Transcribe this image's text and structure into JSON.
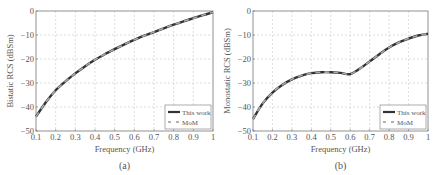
{
  "chart_data": [
    {
      "type": "line",
      "panel_label": "(a)",
      "title": "",
      "xlabel": "Frequency (GHz)",
      "ylabel": "Bistatic RCS (dBSm)",
      "xlim": [
        0.1,
        1
      ],
      "ylim": [
        -50,
        0
      ],
      "x_ticks": [
        "0.1",
        "0.2",
        "0.3",
        "0.4",
        "0.5",
        "0.6",
        "0.7",
        "0.8",
        "0.9",
        "1"
      ],
      "y_ticks": [
        "0",
        "-10",
        "-20",
        "-30",
        "-40",
        "-50"
      ],
      "grid": true,
      "legend_position": "lower right",
      "x": [
        0.1,
        0.15,
        0.2,
        0.25,
        0.3,
        0.35,
        0.4,
        0.45,
        0.5,
        0.55,
        0.6,
        0.65,
        0.7,
        0.75,
        0.8,
        0.85,
        0.9,
        0.95,
        1.0
      ],
      "series": [
        {
          "name": "This work",
          "style": "solid",
          "values": [
            -44,
            -38,
            -33,
            -29.3,
            -26,
            -23,
            -20.3,
            -18,
            -15.9,
            -13.9,
            -12,
            -10.3,
            -8.8,
            -7.2,
            -5.7,
            -4.3,
            -3,
            -1.7,
            -0.5
          ]
        },
        {
          "name": "MoM",
          "style": "dashed",
          "values": [
            -44,
            -38,
            -33,
            -29.3,
            -26,
            -23,
            -20.3,
            -18,
            -15.9,
            -13.9,
            -12,
            -10.3,
            -8.8,
            -7.2,
            -5.7,
            -4.3,
            -3,
            -1.7,
            -0.5
          ]
        }
      ]
    },
    {
      "type": "line",
      "panel_label": "(b)",
      "title": "",
      "xlabel": "Frequency (GHz)",
      "ylabel": "Monostatic RCS (dBSm)",
      "xlim": [
        0.1,
        1
      ],
      "ylim": [
        -50,
        0
      ],
      "x_ticks": [
        "0.1",
        "0.2",
        "0.3",
        "0.4",
        "0.5",
        "0.6",
        "0.7",
        "0.8",
        "0.9",
        "1"
      ],
      "y_ticks": [
        "0",
        "-10",
        "-20",
        "-30",
        "-40",
        "-50"
      ],
      "grid": true,
      "legend_position": "lower right",
      "x": [
        0.1,
        0.15,
        0.2,
        0.25,
        0.3,
        0.35,
        0.4,
        0.45,
        0.5,
        0.55,
        0.6,
        0.65,
        0.7,
        0.75,
        0.8,
        0.85,
        0.9,
        0.95,
        1.0
      ],
      "series": [
        {
          "name": "This work",
          "style": "solid",
          "values": [
            -45,
            -38.5,
            -34,
            -30.8,
            -28.5,
            -26.9,
            -25.9,
            -25.5,
            -25.5,
            -25.8,
            -26.3,
            -24,
            -21,
            -18,
            -15.2,
            -13.1,
            -11.5,
            -10.2,
            -9.5
          ]
        },
        {
          "name": "MoM",
          "style": "dashed",
          "values": [
            -45,
            -38.5,
            -34,
            -30.8,
            -28.5,
            -26.9,
            -25.9,
            -25.5,
            -25.5,
            -25.8,
            -26.3,
            -24,
            -21,
            -18,
            -15.2,
            -13.1,
            -11.5,
            -10.2,
            -9.5
          ]
        }
      ]
    }
  ]
}
